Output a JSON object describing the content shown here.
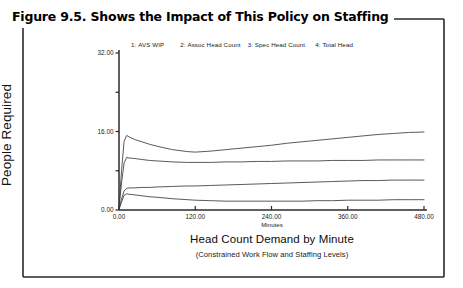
{
  "figure": {
    "title": "Figure 9.5.  Shows the Impact of This Policy on Staffing",
    "border_color": "#2a2a2a",
    "background": "#ffffff"
  },
  "legend": {
    "items": [
      {
        "num": "1:",
        "label": "AVS WIP"
      },
      {
        "num": "2:",
        "label": "Assoc Head Count"
      },
      {
        "num": "3:",
        "label": "Spec Head Count"
      },
      {
        "num": "4:",
        "label": "Total Head"
      }
    ]
  },
  "captions": {
    "x_units": "Minutes",
    "main": "Head Count Demand by Minute",
    "sub": "(Constrained Work Flow and Staffing Levels)"
  },
  "chart_data": {
    "type": "line",
    "title": "Head Count Demand by Minute",
    "subtitle": "(Constrained Work Flow and Staffing Levels)",
    "xlabel": "Minutes",
    "ylabel": "People Required",
    "xlim": [
      0,
      480
    ],
    "ylim": [
      0,
      32
    ],
    "xticks": [
      0,
      120,
      240,
      360,
      480
    ],
    "xtick_labels": [
      "0.00",
      "120.00",
      "240.00",
      "360.00",
      "480.00"
    ],
    "yticks": [
      0,
      8,
      16,
      24,
      32
    ],
    "ytick_labels": [
      "0.00",
      "",
      "16.00",
      "",
      "32.00"
    ],
    "ytick_labels_shown": [
      "0.00",
      "16.00",
      "32.00"
    ],
    "grid": false,
    "legend_position": "top",
    "line_color": "#3c3c3c",
    "x": [
      0,
      4,
      8,
      12,
      16,
      24,
      36,
      48,
      60,
      84,
      108,
      120,
      144,
      168,
      192,
      216,
      240,
      264,
      288,
      312,
      336,
      360,
      384,
      408,
      432,
      456,
      480
    ],
    "series": [
      {
        "name": "Total Head",
        "legend_num": 4,
        "values": [
          0.6,
          8.0,
          14.0,
          15.2,
          14.9,
          14.4,
          13.9,
          13.4,
          13.0,
          12.3,
          11.9,
          11.8,
          12.0,
          12.3,
          12.6,
          12.9,
          13.2,
          13.6,
          13.9,
          14.2,
          14.5,
          14.8,
          15.1,
          15.4,
          15.6,
          15.8,
          15.9
        ]
      },
      {
        "name": "Assoc Head Count",
        "legend_num": 2,
        "values": [
          0.4,
          5.5,
          9.6,
          10.7,
          10.6,
          10.5,
          10.3,
          10.1,
          10.0,
          9.8,
          9.7,
          9.7,
          9.7,
          9.8,
          9.8,
          9.9,
          9.9,
          10.0,
          10.0,
          10.0,
          10.1,
          10.1,
          10.1,
          10.2,
          10.2,
          10.2,
          10.2
        ]
      },
      {
        "name": "Spec Head Count",
        "legend_num": 3,
        "values": [
          0.2,
          2.2,
          3.9,
          4.4,
          4.5,
          4.5,
          4.6,
          4.6,
          4.7,
          4.8,
          4.9,
          4.9,
          5.0,
          5.1,
          5.2,
          5.3,
          5.4,
          5.5,
          5.6,
          5.7,
          5.8,
          5.9,
          6.0,
          6.0,
          6.1,
          6.1,
          6.1
        ]
      },
      {
        "name": "AVS WIP",
        "legend_num": 1,
        "values": [
          0.1,
          1.6,
          3.0,
          3.3,
          3.2,
          3.1,
          2.9,
          2.7,
          2.6,
          2.3,
          2.1,
          2.0,
          1.9,
          1.8,
          1.8,
          1.8,
          1.8,
          1.8,
          1.8,
          1.9,
          1.9,
          2.0,
          2.0,
          2.0,
          2.1,
          2.1,
          2.1
        ]
      }
    ]
  }
}
